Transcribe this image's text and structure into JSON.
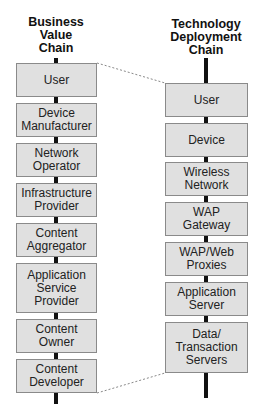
{
  "diagram": {
    "left_chain": {
      "title": "Business\nValue\nChain",
      "items": [
        {
          "label": "User"
        },
        {
          "label": "Device\nManufacturer"
        },
        {
          "label": "Network\nOperator"
        },
        {
          "label": "Infrastructure\nProvider"
        },
        {
          "label": "Content\nAggregator"
        },
        {
          "label": "Application\nService\nProvider"
        },
        {
          "label": "Content\nOwner"
        },
        {
          "label": "Content\nDeveloper"
        }
      ]
    },
    "right_chain": {
      "title": "Technology\nDeployment\nChain",
      "items": [
        {
          "label": "User"
        },
        {
          "label": "Device"
        },
        {
          "label": "Wireless\nNetwork"
        },
        {
          "label": "WAP\nGateway"
        },
        {
          "label": "WAP/Web\nProxies"
        },
        {
          "label": "Application\nServer"
        },
        {
          "label": "Data/\nTransaction\nServers"
        }
      ]
    },
    "colors": {
      "box_fill": "#e0e0e0",
      "box_border": "#8a8a8a",
      "spine": "#111111",
      "connector": "#888888"
    }
  }
}
